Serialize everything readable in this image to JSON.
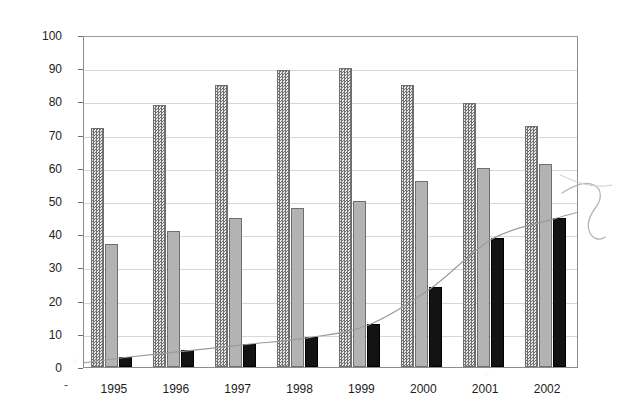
{
  "chart_data": {
    "type": "bar",
    "title": "",
    "subtitle": "",
    "xlabel": "",
    "ylabel": "Minutes (billions)",
    "categories": [
      "1995",
      "1996",
      "1997",
      "1998",
      "1999",
      "2000",
      "2001",
      "2002"
    ],
    "series": [
      {
        "name": "series-1-dotted",
        "pattern": "dotted",
        "color": "#8f8f8f",
        "values": [
          72,
          79,
          85,
          89.5,
          90,
          85,
          79.5,
          72.5
        ]
      },
      {
        "name": "series-2-gray",
        "pattern": "solid",
        "color": "#b3b3b3",
        "values": [
          37,
          41,
          45,
          48,
          50,
          56,
          60,
          61
        ]
      },
      {
        "name": "series-3-black",
        "pattern": "solid",
        "color": "#131313",
        "values": [
          3,
          5,
          7,
          9,
          13,
          24,
          39,
          45
        ]
      }
    ],
    "overlay_line": {
      "name": "trend-curve",
      "color": "#9a9a9a",
      "values": [
        3,
        5,
        7,
        9,
        13,
        24,
        39,
        45
      ]
    },
    "ylim": [
      0,
      100
    ],
    "yticks": [
      0,
      10,
      20,
      30,
      40,
      50,
      60,
      70,
      80,
      90,
      100
    ],
    "ytick_labels": [
      "0",
      "10",
      "20",
      "30",
      "40",
      "50",
      "60",
      "70",
      "80",
      "90",
      "100"
    ],
    "grid": true,
    "grid_axis": "y",
    "legend": "none",
    "legend_position": "none",
    "annotations": [
      "axis-origin-dash"
    ],
    "axis_origin_marker": "-"
  }
}
